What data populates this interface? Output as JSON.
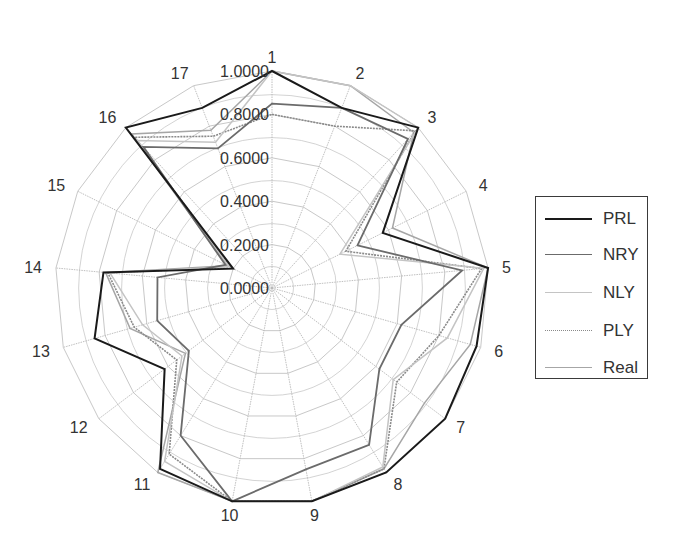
{
  "chart_data": {
    "type": "radar",
    "title": "",
    "categories": [
      "1",
      "2",
      "3",
      "4",
      "5",
      "6",
      "7",
      "8",
      "9",
      "10",
      "11",
      "12",
      "13",
      "14",
      "15",
      "16",
      "17"
    ],
    "radial_ticks": [
      "0.0000",
      "0.2000",
      "0.4000",
      "0.6000",
      "0.8000",
      "1.0000"
    ],
    "rlim": [
      0,
      1
    ],
    "grid": true,
    "legend_position": "right",
    "series": [
      {
        "name": "PRL",
        "color": "#1a1a1a",
        "width": 2.0,
        "dash": "",
        "values": [
          1.0,
          0.89,
          1.0,
          0.57,
          1.0,
          0.98,
          1.0,
          1.0,
          1.0,
          1.0,
          0.98,
          0.62,
          0.85,
          0.78,
          0.2,
          1.0,
          0.89
        ]
      },
      {
        "name": "NRY",
        "color": "#6b6b6b",
        "width": 1.8,
        "dash": "",
        "values": [
          0.85,
          0.89,
          0.93,
          0.44,
          0.88,
          0.62,
          0.62,
          0.85,
          0.85,
          1.0,
          0.8,
          0.48,
          0.55,
          0.53,
          0.24,
          0.88,
          0.69
        ]
      },
      {
        "name": "NLY",
        "color": "#c4c4c4",
        "width": 1.5,
        "dash": "",
        "values": [
          1.0,
          1.0,
          1.0,
          0.35,
          0.98,
          0.84,
          0.7,
          0.97,
          1.0,
          1.0,
          0.94,
          0.52,
          0.62,
          0.75,
          0.22,
          0.92,
          0.72
        ]
      },
      {
        "name": "PLY",
        "color": "#8a8a8a",
        "width": 1.6,
        "dash": "2,1",
        "values": [
          0.8,
          0.8,
          0.98,
          0.38,
          0.97,
          0.8,
          0.72,
          0.98,
          1.0,
          1.0,
          0.9,
          0.55,
          0.66,
          0.76,
          0.21,
          0.94,
          0.75
        ]
      },
      {
        "name": "Real",
        "color": "#a6a6a6",
        "width": 1.5,
        "dash": "",
        "values": [
          1.0,
          1.0,
          0.97,
          0.62,
          1.0,
          0.95,
          0.88,
          0.98,
          1.0,
          1.0,
          1.0,
          0.5,
          0.68,
          0.77,
          0.23,
          0.96,
          0.78
        ]
      }
    ]
  },
  "legend": {
    "items": [
      {
        "label": "PRL"
      },
      {
        "label": "NRY"
      },
      {
        "label": "NLY"
      },
      {
        "label": "PLY"
      },
      {
        "label": "Real"
      }
    ]
  },
  "style": {
    "grid_color": "#c8c8c8",
    "spoke_color": "#b8b8b8"
  }
}
